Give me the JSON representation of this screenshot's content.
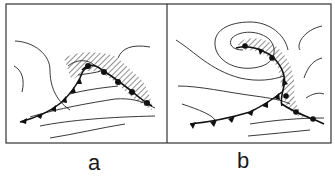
{
  "figure": {
    "panels": [
      {
        "id": "a",
        "label": "a",
        "description": "occlusion beginning: cold front with triangles, warm front with semicircles, hatched precipitation area"
      },
      {
        "id": "b",
        "label": "b",
        "description": "mature occluded cyclone: spiraling isobars, occluded front wrapping into low center, hatched precipitation band"
      }
    ],
    "colors": {
      "line": "#222222",
      "background": "#ffffff"
    }
  }
}
